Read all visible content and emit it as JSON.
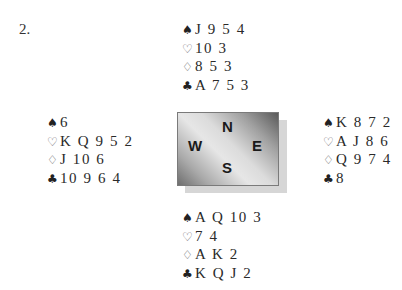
{
  "problem": {
    "number": "2."
  },
  "compass": {
    "north": "N",
    "south": "S",
    "east": "E",
    "west": "W"
  },
  "suits": {
    "spades": "♠",
    "hearts": "♡",
    "diamonds": "♢",
    "clubs": "♣"
  },
  "hands": {
    "north": {
      "spades": "J 9 5 4",
      "hearts": "10 3",
      "diamonds": "8 5 3",
      "clubs": "A 7 5 3"
    },
    "west": {
      "spades": "6",
      "hearts": "K Q 9 5 2",
      "diamonds": "J 10 6",
      "clubs": "10 9 6 4"
    },
    "east": {
      "spades": "K 8 7 2",
      "hearts": "A J 8 6",
      "diamonds": "Q 9 7 4",
      "clubs": "8"
    },
    "south": {
      "spades": "A Q 10 3",
      "hearts": "7 4",
      "diamonds": "A K 2",
      "clubs": "K Q J 2"
    }
  }
}
